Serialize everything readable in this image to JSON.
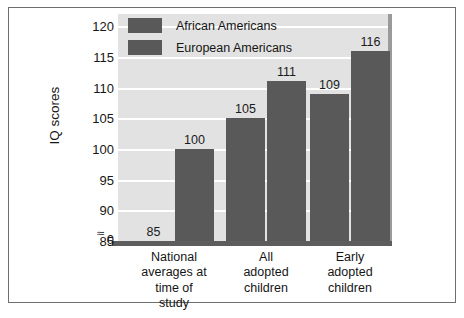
{
  "chart_data": {
    "type": "bar",
    "title": "",
    "xlabel": "",
    "ylabel": "IQ scores",
    "ylim": [
      85,
      122
    ],
    "yticks": [
      "0",
      "85",
      "90",
      "95",
      "100",
      "105",
      "110",
      "115",
      "120"
    ],
    "axis_break": "≈",
    "grid": true,
    "legend_position": "top-left-inside",
    "categories": [
      "National\naverages at\ntime of\nstudy",
      "All\nadopted\nchildren",
      "Early\nadopted\nchildren"
    ],
    "category_lines": [
      [
        "National",
        "averages at",
        "time of",
        "study"
      ],
      [
        "All",
        "adopted",
        "children"
      ],
      [
        "Early",
        "adopted",
        "children"
      ]
    ],
    "series": [
      {
        "name": "African Americans",
        "values": [
          85,
          105,
          109
        ],
        "color": "#595959"
      },
      {
        "name": "European Americans",
        "values": [
          100,
          111,
          116
        ],
        "color": "#595959"
      }
    ],
    "value_labels": [
      "85",
      "100",
      "105",
      "111",
      "109",
      "116"
    ]
  },
  "legend": {
    "items": [
      {
        "label": "African Americans"
      },
      {
        "label": "European Americans"
      }
    ]
  },
  "colors": {
    "bar": "#595959",
    "plot_background": "#e2e2e2",
    "gridline": "#ffffff",
    "axis": "#5d5d5d",
    "frame": "#6f6f6f",
    "page_background": "#ffffff",
    "text": "#151515"
  }
}
